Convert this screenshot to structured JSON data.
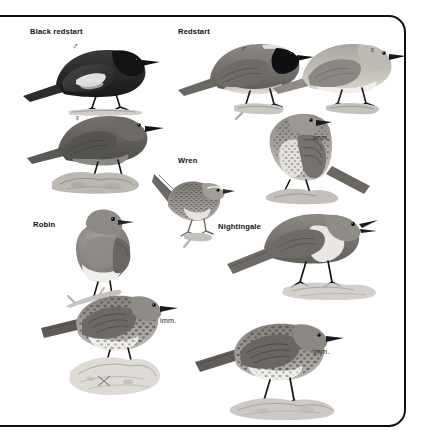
{
  "page": {
    "kind": "field-guide-plate",
    "background": "#ffffff",
    "border_color": "#101010",
    "art_style": "grayscale-halftone-illustration"
  },
  "labels": [
    {
      "id": "black-redstart",
      "text": "Black redstart",
      "x": 30,
      "y": 31,
      "weight": "bold"
    },
    {
      "id": "redstart",
      "text": "Redstart",
      "x": 178,
      "y": 31,
      "weight": "bold"
    },
    {
      "id": "wren",
      "text": "Wren",
      "x": 178,
      "y": 160,
      "weight": "bold"
    },
    {
      "id": "robin",
      "text": "Robin",
      "x": 33,
      "y": 224,
      "weight": "bold"
    },
    {
      "id": "nightingale",
      "text": "Nightingale",
      "x": 218,
      "y": 226,
      "weight": "bold"
    },
    {
      "id": "imm-redstart",
      "text": "imm.",
      "x": 313,
      "y": 137,
      "weight": "normal"
    },
    {
      "id": "imm-robin",
      "text": "imm.",
      "x": 160,
      "y": 320,
      "weight": "normal"
    },
    {
      "id": "imm-nightingale",
      "text": "imm.",
      "x": 313,
      "y": 351,
      "weight": "normal"
    }
  ],
  "sex_symbols": [
    {
      "id": "male-black-redstart",
      "glyph": "♂",
      "x": 72,
      "y": 47
    },
    {
      "id": "male-redstart",
      "glyph": "♂",
      "x": 240,
      "y": 50
    },
    {
      "id": "female-redstart",
      "glyph": "♀",
      "x": 369,
      "y": 51
    },
    {
      "id": "female-black-redstart",
      "glyph": "♀",
      "x": 74,
      "y": 119
    }
  ],
  "birds": [
    {
      "id": "black-redstart-male",
      "common_name": "Black redstart",
      "plumage": "male",
      "tone": "dark",
      "x": 20,
      "y": 38,
      "w": 140,
      "h": 72,
      "facing": "right",
      "perch": "branch"
    },
    {
      "id": "redstart-male",
      "common_name": "Redstart",
      "plumage": "male",
      "tone": "mid",
      "x": 178,
      "y": 38,
      "w": 128,
      "h": 78,
      "facing": "right",
      "perch": "branch"
    },
    {
      "id": "redstart-female",
      "common_name": "Redstart",
      "plumage": "female",
      "tone": "pale",
      "x": 272,
      "y": 35,
      "w": 130,
      "h": 78,
      "facing": "right",
      "perch": "branch"
    },
    {
      "id": "black-redstart-female",
      "common_name": "Black redstart",
      "plumage": "female",
      "tone": "mid-dark",
      "x": 28,
      "y": 108,
      "w": 135,
      "h": 82,
      "facing": "right",
      "perch": "rock"
    },
    {
      "id": "redstart-immature",
      "common_name": "Redstart",
      "plumage": "immature",
      "tone": "speckled",
      "x": 238,
      "y": 110,
      "w": 128,
      "h": 90,
      "facing": "right",
      "perch": "rock"
    },
    {
      "id": "wren",
      "common_name": "Wren",
      "plumage": "adult",
      "tone": "barred",
      "x": 152,
      "y": 170,
      "w": 78,
      "h": 72,
      "facing": "right",
      "perch": "twig"
    },
    {
      "id": "robin",
      "common_name": "Robin",
      "plumage": "adult",
      "tone": "mid",
      "x": 62,
      "y": 208,
      "w": 78,
      "h": 96,
      "facing": "front",
      "perch": "twig"
    },
    {
      "id": "nightingale",
      "common_name": "Nightingale",
      "plumage": "adult",
      "tone": "mid",
      "x": 228,
      "y": 208,
      "w": 148,
      "h": 92,
      "facing": "right",
      "perch": "rock",
      "note": "singing, bill open"
    },
    {
      "id": "robin-immature",
      "common_name": "Robin",
      "plumage": "immature",
      "tone": "speckled",
      "x": 42,
      "y": 292,
      "w": 140,
      "h": 100,
      "facing": "right",
      "perch": "rock"
    },
    {
      "id": "nightingale-immature",
      "common_name": "Nightingale",
      "plumage": "immature",
      "tone": "speckled",
      "x": 196,
      "y": 320,
      "w": 150,
      "h": 96,
      "facing": "right",
      "perch": "rock"
    }
  ]
}
